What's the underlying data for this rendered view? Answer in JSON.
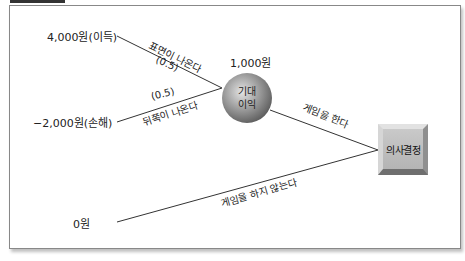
{
  "diagram": {
    "type": "decision-tree",
    "outcomes": {
      "heads_value": "4,000원(이득)",
      "tails_value": "−2,000원(손해)",
      "no_game_value": "0원"
    },
    "branches": {
      "heads_label": "표면이 나온다",
      "heads_prob": "(0.5)",
      "tails_label": "뒤쪽이 나온다",
      "tails_prob": "(0.5)",
      "play_label": "게임을 한다",
      "no_play_label": "게임을 하지 않는다"
    },
    "chance_node": {
      "value": "1,000원",
      "label_line1": "기대",
      "label_line2": "이익"
    },
    "decision_node": {
      "label": "의사결정"
    },
    "colors": {
      "line": "#333333",
      "frame": "#888888",
      "node_fill": "#9a9a9a",
      "box_fill": "#c0c0c0"
    }
  }
}
